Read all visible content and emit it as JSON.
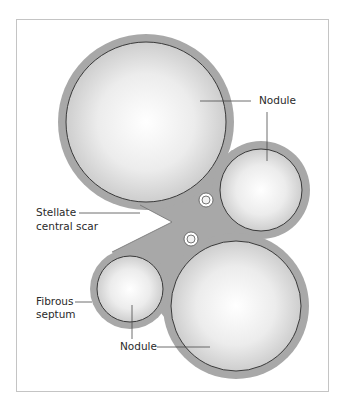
{
  "figure": {
    "type": "anatomical-diagram"
  },
  "colors": {
    "septum_fill": "#a8a8a8",
    "septum_outline": "#6e6e6e",
    "nodule_center": "#ffffff",
    "nodule_edge": "#c9c9c9",
    "frame_border": "#c4c4c4",
    "label_text": "#2a2a2a",
    "leader_line": "#4a4a4a"
  },
  "structures": {
    "nodules": [
      {
        "name": "large-upper-nodule",
        "cx": 146,
        "cy": 122,
        "r_inner": 80,
        "r_outer": 88
      },
      {
        "name": "upper-right-nodule",
        "cx": 261,
        "cy": 190,
        "r_inner": 41,
        "r_outer": 49
      },
      {
        "name": "lower-right-nodule",
        "cx": 236,
        "cy": 306,
        "r_inner": 65,
        "r_outer": 73
      },
      {
        "name": "lower-left-nodule",
        "cx": 130,
        "cy": 289,
        "r_inner": 33,
        "r_outer": 40
      }
    ],
    "vessels": [
      {
        "name": "vessel-upper",
        "cx": 206,
        "cy": 200
      },
      {
        "name": "vessel-lower",
        "cx": 191,
        "cy": 239
      }
    ]
  },
  "labels": {
    "nodule_top": "Nodule",
    "stellate_line1": "Stellate",
    "stellate_line2": "central scar",
    "fibrous_line1": "Fibrous",
    "fibrous_line2": "septum",
    "nodule_bottom": "Nodule"
  }
}
